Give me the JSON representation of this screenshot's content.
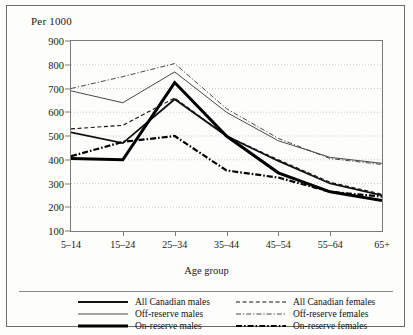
{
  "chart_data": {
    "type": "line",
    "title": "",
    "ylabel": "Per 1000",
    "xlabel": "Age group",
    "categories": [
      "5–14",
      "15–24",
      "25–34",
      "35–44",
      "45–54",
      "55–64",
      "65+"
    ],
    "ylim": [
      100,
      900
    ],
    "yticks": [
      100,
      200,
      300,
      400,
      500,
      600,
      700,
      800,
      900
    ],
    "grid": true,
    "grid_style": "dotted-horizontal",
    "legend_position": "bottom",
    "series": [
      {
        "name": "All Canadian males",
        "style": "solid",
        "width": 1.8,
        "color": "#111111",
        "values": [
          515,
          470,
          655,
          500,
          395,
          300,
          250
        ]
      },
      {
        "name": "All Canadian females",
        "style": "dashed",
        "width": 1.1,
        "color": "#111111",
        "values": [
          530,
          545,
          660,
          500,
          400,
          305,
          255
        ]
      },
      {
        "name": "Off-reserve males",
        "style": "solid",
        "width": 0.9,
        "color": "#333333",
        "values": [
          690,
          640,
          770,
          600,
          480,
          410,
          385
        ]
      },
      {
        "name": "Off-reserve females",
        "style": "dash-dot",
        "width": 0.9,
        "color": "#333333",
        "values": [
          700,
          750,
          805,
          615,
          490,
          405,
          380
        ]
      },
      {
        "name": "On-reserve males",
        "style": "solid",
        "width": 3.0,
        "color": "#000000",
        "values": [
          405,
          400,
          725,
          500,
          345,
          265,
          228
        ]
      },
      {
        "name": "On-reserve females",
        "style": "dash-dot",
        "width": 2.2,
        "color": "#000000",
        "values": [
          415,
          475,
          500,
          355,
          325,
          265,
          245
        ]
      }
    ]
  },
  "legend": {
    "items": [
      {
        "label": "All Canadian males",
        "swatch": "solid-medium"
      },
      {
        "label": "All Canadian females",
        "swatch": "dashed-thin"
      },
      {
        "label": "Off-reserve males",
        "swatch": "solid-thin"
      },
      {
        "label": "Off-reserve females",
        "swatch": "dashdot-thin"
      },
      {
        "label": "On-reserve males",
        "swatch": "solid-thick"
      },
      {
        "label": "On-reserve females",
        "swatch": "dashdot-thick"
      }
    ]
  }
}
